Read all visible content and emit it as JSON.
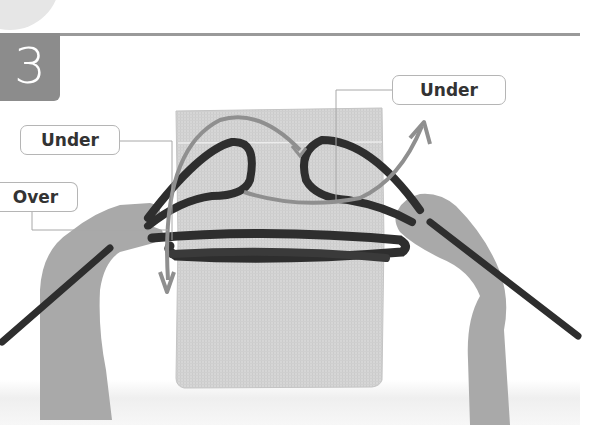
{
  "step": {
    "number": "3"
  },
  "callouts": {
    "under_right": "Under",
    "under_left": "Under",
    "over": "Over"
  },
  "colors": {
    "badge": "#8c8c8c",
    "rule": "#9a9a9a",
    "board": "#d4d4d4",
    "rope": "#2e2e2e",
    "arrow": "#8f8f8f",
    "callout_border": "#b5b5b5",
    "callout_text": "#333333"
  }
}
